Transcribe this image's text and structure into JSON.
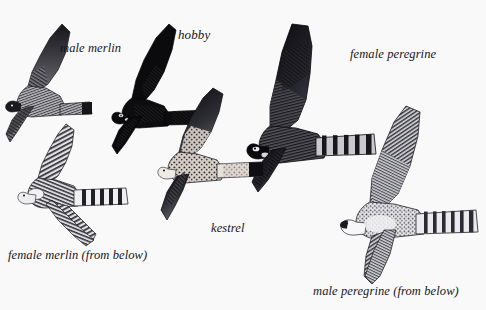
{
  "plate": {
    "kind": "field-guide-illustration-plate",
    "medium": "pen-and-ink engraving",
    "background_color": "#f9f9fa",
    "ink_color": "#1a1a1a",
    "width": 486,
    "height": 310
  },
  "birds": [
    {
      "id": "male-merlin",
      "caption": "male merlin",
      "view": "from above",
      "tone": "medium grey, finely hatched",
      "caption_position": {
        "x": 60,
        "y": 42
      }
    },
    {
      "id": "hobby",
      "caption": "hobby",
      "view": "from above",
      "tone": "very dark, near solid black",
      "caption_position": {
        "x": 178,
        "y": 28
      }
    },
    {
      "id": "female-peregrine",
      "caption": "female peregrine",
      "view": "from above",
      "tone": "dark, heavy hatching, barred tail",
      "caption_position": {
        "x": 350,
        "y": 48
      }
    },
    {
      "id": "female-merlin",
      "caption": "female merlin (from below)",
      "view": "from below",
      "tone": "pale, heavily barred underparts and tail",
      "caption_position": {
        "x": 8,
        "y": 249
      }
    },
    {
      "id": "kestrel",
      "caption": "kestrel",
      "view": "from above",
      "tone": "speckled, pale body, dark terminal tail band",
      "caption_position": {
        "x": 211,
        "y": 222
      }
    },
    {
      "id": "male-peregrine",
      "caption": "male peregrine (from below)",
      "view": "from below",
      "tone": "pale breast, finely barred wings and tail",
      "caption_position": {
        "x": 313,
        "y": 285
      }
    }
  ]
}
